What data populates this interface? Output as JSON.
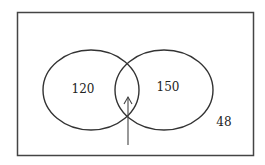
{
  "diagram": {
    "type": "venn",
    "sets": [
      {
        "name": "left-set",
        "only_value": "120"
      },
      {
        "name": "right-set",
        "only_value": "150"
      }
    ],
    "intersection": {
      "value": "",
      "indicator": "arrow pointing to intersection"
    },
    "outside_value": "48"
  },
  "colors": {
    "stroke": "#333333",
    "background": "#ffffff"
  }
}
